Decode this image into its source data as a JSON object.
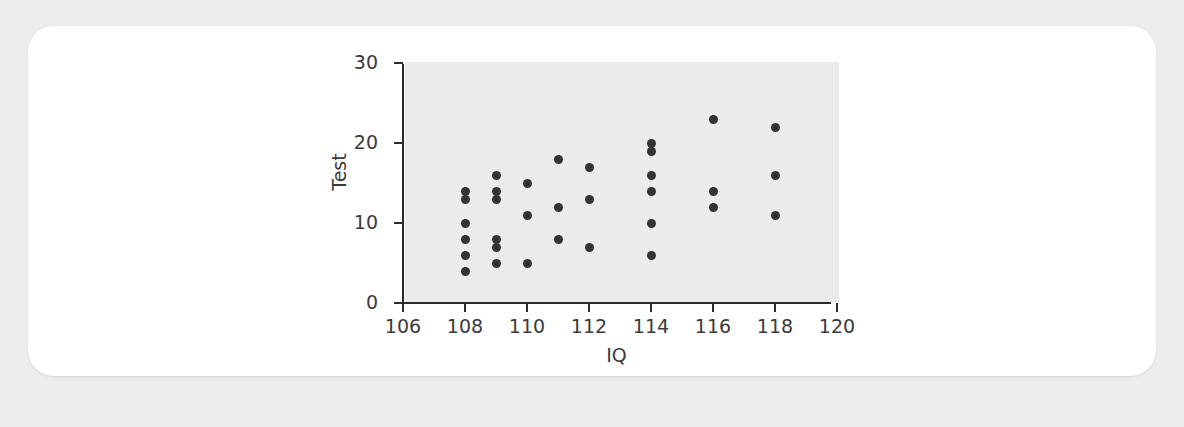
{
  "chart_data": {
    "type": "scatter",
    "title": "",
    "xlabel": "IQ",
    "ylabel": "Test",
    "xlim": [
      106,
      120
    ],
    "ylim": [
      0,
      30
    ],
    "xticks": [
      106,
      108,
      110,
      112,
      114,
      116,
      118,
      120
    ],
    "yticks": [
      0,
      10,
      20,
      30
    ],
    "grid": false,
    "legend": null,
    "marker": {
      "shape": "circle",
      "color": "#333333",
      "size": 9
    },
    "panel_color": "#ebebeb",
    "points": [
      {
        "x": 108,
        "y": 14
      },
      {
        "x": 108,
        "y": 13
      },
      {
        "x": 108,
        "y": 10
      },
      {
        "x": 108,
        "y": 8
      },
      {
        "x": 108,
        "y": 6
      },
      {
        "x": 108,
        "y": 4
      },
      {
        "x": 109,
        "y": 16
      },
      {
        "x": 109,
        "y": 14
      },
      {
        "x": 109,
        "y": 13
      },
      {
        "x": 109,
        "y": 8
      },
      {
        "x": 109,
        "y": 7
      },
      {
        "x": 109,
        "y": 5
      },
      {
        "x": 110,
        "y": 15
      },
      {
        "x": 110,
        "y": 11
      },
      {
        "x": 110,
        "y": 5
      },
      {
        "x": 111,
        "y": 18
      },
      {
        "x": 111,
        "y": 12
      },
      {
        "x": 111,
        "y": 8
      },
      {
        "x": 112,
        "y": 17
      },
      {
        "x": 112,
        "y": 13
      },
      {
        "x": 112,
        "y": 7
      },
      {
        "x": 114,
        "y": 20
      },
      {
        "x": 114,
        "y": 19
      },
      {
        "x": 114,
        "y": 16
      },
      {
        "x": 114,
        "y": 14
      },
      {
        "x": 114,
        "y": 10
      },
      {
        "x": 114,
        "y": 6
      },
      {
        "x": 116,
        "y": 23
      },
      {
        "x": 116,
        "y": 14
      },
      {
        "x": 116,
        "y": 12
      },
      {
        "x": 118,
        "y": 22
      },
      {
        "x": 118,
        "y": 16
      },
      {
        "x": 118,
        "y": 11
      }
    ]
  }
}
